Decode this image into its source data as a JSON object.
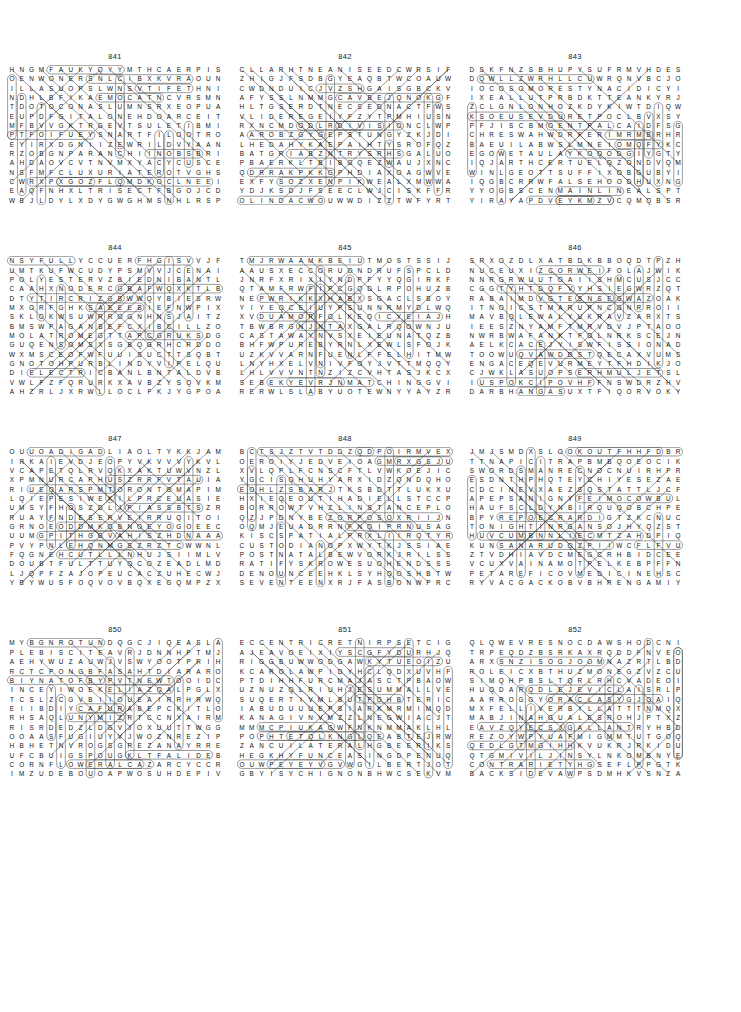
{
  "page": {
    "type": "word-search-puzzle-page",
    "columns": 3,
    "rows": 4,
    "grid_rows_per_puzzle": 21,
    "grid_cols_per_puzzle": 22
  },
  "puzzles": [
    {
      "number": "841",
      "grid": [
        "HNGMFAUKYQYYMTHCAERPIS",
        "OENWONERSNLCIBXKVRAOUN",
        "ILLASUOPSLWNSVTIFETHNI",
        "NDHLBFIKAEMOCATNCVRSMN",
        "TDOTOCONASLUMNSRXEOPUA",
        "EUPDFGITALONEHDOARCEIT",
        "MFBVVGKTRGEVTSULETIBMI",
        "PTFOIFUEYSNARTFILOOTRO",
        "EYIRXDGNIIZEWRILDVYAAN",
        "RZOBGNPARANCHIINOBSBRI",
        "AHDAOVCVTNVMXYACYCUSCE",
        "NSFMFCLUXURIATEROTVGHS",
        "CWRXPXGOZFLQMDKOCLNEEI",
        "EAQFNHXLTRISECTFBGOJCD",
        "WBJLDYLXDYGWGHMSNHLRSP"
      ],
      "found_words": [
        "TRISECT",
        "LUXURIATE",
        "RANCH",
        "ALONE",
        "RENOWNED",
        "ESPOUSAL",
        "CONSULTANT",
        "TRANSFIX",
        "ACHE"
      ]
    },
    {
      "number": "842",
      "grid": [
        "CLLARHTNEANISEEDCWRSIF",
        "ZHIGJFSDBGYEAQBTWCOAUW",
        "CWDNDUICJVZSHGAISGBCKV",
        "AFYSSLNMMGCAVBEJQNOKGF",
        "HLTGSERDTNECSEDNACTFWS",
        "VLIDEREGEIYFZYTPMHIUSN",
        "RXNCMDODLRDIVISIONCLWP",
        "AAROBZGYGEPSTUNGYZKJDI",
        "LHEDAHYKAEPAIHTYSROFQZ",
        "BATGRIABZNTRYSRHSGALUO",
        "PBAERKLTBIBGQEZWAUJXNC",
        "QDRRAKPKKGPHDIAXOAGWVE",
        "EXFYSOZXENPIKWEALXMWWA",
        "YDJKSDJFSEECLWJCISKFFR",
        "OLINDACWOUWWDIZZTWFYRT"
      ],
      "found_words": [
        "DIVISION",
        "OLINDA",
        "FORSYTHIA",
        "DESCENDANT",
        "ANISEED",
        "GUNSTPE",
        "HARTALL"
      ]
    },
    {
      "number": "843",
      "grid": [
        "DSKFNZSBHUPYSUFRMVHDES",
        "DQWLLZWRHLLCUWRQNVBCJO",
        "IOCOSOMORESTYNACIDICYI",
        "IXEALLUTPRBDKTTEANKYRJ",
        "ZCLGNLONHOZKDYKIWTDIQW",
        "KSOEUSEVDURETPOCLBVXSY",
        "PFJISCBMOENTPALCAIDFSG",
        "CHRESWAHWDRFERIMRMBRHR",
        "BAEUILABWSLMNEIOMQFYKC",
        "EGOWETAULAYKOQODGIYGTY",
        "IQJARTHCERTUELQZONDVQM",
        "WINLGEOTTSUFFIXOBGUBYI",
        "IQGBCRRWFALSEHOODHUXNG",
        "YYOGBSCENMAINLINEALSPT",
        "YIRAYAPDVEYKMZVCQMQBSR"
      ],
      "found_words": [
        "ACIDIC",
        "SUFFIX",
        "FALSEHOOD",
        "MAINLINE",
        "MORES",
        "COPTER",
        "SMORES"
      ]
    },
    {
      "number": "844",
      "grid": [
        "NSYFULLYCCUERFHGISVVJF",
        "UMTKUFWCUDYPSMVVJCENAI",
        "POLYESTERVZBIEDNIBANTL",
        "CAAHXNODERCGBAFWQXKTLB",
        "DTYTIRCRIZGBWWQYBIESRW",
        "MXORFGHKSAEEEBIEFNWPIX",
        "SKLOKWSUWRROGNHNSJAITZ",
        "BMSWPAGANBEFCXIBCILLZO",
        "MOLATROMEGTTAPCGRUKSDG",
        "GUQENSOMSXSGBQGRHCRDDO",
        "WXMSCEOFWFUUISUCTTSQBT",
        "GNOTOHPURBLINDYVIPELQU",
        "DIELECTRICBANLBNTALDVB",
        "VWLFZFQRURKXAVBZYSQVKM",
        "AHZRLJXRWLLOCLFKJYGPOA"
      ],
      "found_words": [
        "FULLY",
        "POLYESTER",
        "DIELECTRIC",
        "PAGAN",
        "LATROME",
        "PHOTON",
        "BLIND",
        "CODER"
      ]
    },
    {
      "number": "845",
      "grid": [
        "TMJRWAAMKBEIUTMOSTSSIJ",
        "AAUSXECCORUONDRUFSPCLD",
        "JNRFXRIXIYNDPFYYQGIRKF",
        "QTAMFRWFIPCGQDLRPOHUZB",
        "NEPWRIKKXHABXSGACLSBOY",
        "YIYEQCEIUYPSUNNRMYDLWQ",
        "XVDUAMORFOLKEQICYEIAJH",
        "TBWBRGNJNTAXGALRQOWNJU",
        "CASTAWAYNVSXEIEUNATQZB",
        "BHFWPUREBYRNLXEWLSFOJK",
        "UZKVVARNFUENLFFELHITMW",
        "LNYHXELVNIVFOYJVTTMQQY",
        "LHLVVVNTNZIZCVHTASJKCX",
        "SEBEKYEVRJNMATCHINGGVI",
        "RERWLSLABYUOTEWNYYAYZR"
      ],
      "found_words": [
        "UTMOST",
        "CASTAWAY",
        "MATCHING",
        "NORFOLK",
        "PURE",
        "SCORCH"
      ]
    },
    {
      "number": "846",
      "grid": [
        "SRXOZDLXATBDKBBOQDTPZH",
        "NUCEUXIZCORWEIFOLAJWIK",
        "NNRGRWUUTOAIISHMCUSJCC",
        "CGGTYHTDQFVYHSIEGWRZQT",
        "RABAIMDVGTESNSEGWAZOAK",
        "ITNOICSTMARUPNCGNRROII",
        "MAVBQLEWALYUKRAVZARXTS",
        "IEESZNYAMFTMRVDVJPTAOO",
        "NWRBWAFANKTFOLNRKSCEJN",
        "AELKCACEJYISWFISSIONAD",
        "TOOWUQVAWDDSTQECAXVUMS",
        "ENGACEQEVURMEYTFHDIKJO",
        "CJWKLASUOPSERHMULJETSL",
        "IUSPOKCIPOVHFFNSWDRZHV",
        "DARBHANGASUXTFIQORVOKY"
      ],
      "found_words": [
        "FISSION",
        "DARBHANGA",
        "ESPOUSAL",
        "PICKOPS",
        "CACKLE",
        "FOLA"
      ]
    },
    {
      "number": "847",
      "grid": [
        "OUUOADIGADLIAOLTYKKJAM",
        "IRKAIEVDJEOPYVKVVVYKVL",
        "VCAPETQLRVQKXAKTUWVNZL",
        "XPMNURCAPHUSZRRFVTAUIA",
        "RIUEQARSPMTORONTOMAPIM",
        "LQIEPESIWEKILPRCEUASIE",
        "UMSYFHOSZDLJPIASSBTSZR",
        "RUAYFNDESERVEIRRUQITOI",
        "GRNOEODDMKQBNOEYOGOEEC",
        "UUMGPITHGGVAHISZHDNAAA",
        "PVYPNLEHQNMGSZRZTCWWNL",
        "FQGNEHCUTLLLNHUJSIIMLV",
        "DOUBTFULTTUYQCOZEADLMD",
        "LJQPFZAJOPEUCACZUHECWJ",
        "YBYWUSFOQVOVBQXEGQMPZX"
      ],
      "found_words": [
        "TORONTO",
        "DESERVE",
        "DOUBTFUL",
        "CUTHENG",
        "LIKEWISE",
        "CAPE"
      ]
    },
    {
      "number": "848",
      "grid": [
        "BCTSJZTVTDDZQDPOIRMVEX",
        "OEROIYJEDVEIOAGMRXGSJU",
        "XVLQPLFCNSCFTLVWKOEJIC",
        "YGCISQHUHYARXIDZQNDQHO",
        "EOHLZSBARJTKSBDTTLUKXU",
        "HXIEQEOUTIHADIELLSTCCP",
        "BORROWTVHZLINSTANCEPLO",
        "QZJPDNYBEZORPOSOXRIIJN",
        "OQMJEUADRRNFNQIPRNUSAG",
        "KISCSPATIALPRXLIIRQTYR",
        "CUSTODIANOPXWYTKJSSIAE",
        "POSTNATALBEWVORKJRILSS",
        "RATIFYSKROWESUOHENDSSS",
        "DENOUNCEEHKLSYHQOSHBTW",
        "SEVENTEENXRJFASBONWPRC"
      ],
      "found_words": [
        "BORROW",
        "INSTANCE",
        "SPATIAL",
        "CUSTODIAN",
        "POSTNATAL",
        "RATIFY",
        "DENOUNCE",
        "SEVENTEEN",
        "HOUSEWORKS",
        "ADIELLS"
      ]
    },
    {
      "number": "849",
      "grid": [
        "JMJSMDXSLOOKOUTFHHFDBR",
        "TTNAPICITRAPBMBQOEOCIK",
        "SWORDSMANRECNOCNUIRHPR",
        "ESDNTHPHQTEYCHIYESEZAE",
        "CDCINEVXAEZSQSTATTLJCF",
        "APEPSANIGNYFEIMOCOWBUL",
        "HAUFSCLDYNBIRQUQOBCHPE",
        "BPYREPOECRARDIGTZKCNUC",
        "TONIGHTINRGANSOJHYQZST",
        "HUVCUMBNNLIECMTZAHDPIQ",
        "KUNSANARUDQZPIIWCFLFVU",
        "ZTVDHIAVDCMEGCRHBIDCEE",
        "VCUXVAINAMOTPELKEBPFFN",
        "PETAREFICOVMEDICINEHSC",
        "RYVACGACKOBVBHRENGAMIY"
      ],
      "found_words": [
        "LOOKOUT",
        "PARTICIPANT",
        "SWORDSMAN",
        "CONCERN",
        "TONIGHT",
        "KUNSAN",
        "KLEPTOMANIA",
        "MEDICINE",
        "VOCIFERATE",
        "MAGNETISM"
      ]
    },
    {
      "number": "850",
      "grid": [
        "MYBGNROTUNDQGCJIQEASLA",
        "PLEBISCITEAVRJDNNHPTMJ",
        "AEHYWUZAUWJVSWYOOTPRIH",
        "RCTCPONGBFASAHTDIARARO",
        "BIYNATOFBYPVTNEWTOOIDC",
        "INCEYIWOEKELIAZQALPGLX",
        "TCSLZCGVBIIOUEAIRRHRWQ",
        "EIIBDIYCAFURABEPCKITLO",
        "RHSAQLUNYMIZRTCCNXAIRM",
        "RISRDEDZLDGVJOXUUTTWGG",
        "OOAASFUGIUYVJWOZNREZIP",
        "HBHETNVROGSGREZANAYRRE",
        "UFCBUIGSPOUGKLTFALIDEB",
        "CORNFLOWERALCAZARCYCCR",
        "IMZUDEBOUOAPWOSUHDEPIV"
      ],
      "found_words": [
        "ROTUND",
        "PLEBISCITE",
        "CORNFLOWER",
        "ALCAZAR",
        "SWALLOW"
      ]
    },
    {
      "number": "851",
      "grid": [
        "ECCENTRICRETNIRPSETCIG",
        "AJEAVOEIXIYSCGFYDURHJQ",
        "RIGGBUWWODGAWKYTUEOIZU",
        "KCAROLAWPIDYHCLQDXUVHF",
        "PTDIHHFURCMAJASCTPBAOW",
        "UZNUZQLRIUHJESUMMALLVE",
        "SUQERTIVMLBUTPOHBTERIC",
        "IABUDUUUEPBIARKMRMIMQD",
        "KANAGIVNVMZZLNEGWIACJT",
        "MMMCPIUKAGWFNKNMMAKLHL",
        "POPHTETQLKNGLQEABTEJRW",
        "ZANCUILATERALHGBEERIKS",
        "HEGKHYFUNCEASINGDPENUQ",
        "OUWPEYEYVGVWGILBERTJOT",
        "GBYISYCHIGNONBHWCSEKVM"
      ],
      "found_words": [
        "ECCENTRIC",
        "SPRINTER",
        "CAROL",
        "UNCEASING",
        "GILBERT",
        "CHIGNON",
        "UNILATERAL",
        "SUBDUE",
        "GAWKY"
      ]
    },
    {
      "number": "852",
      "grid": [
        "QLQWEVRESNOCDAWSHODCNI",
        "TRPEQDZBSRKAXRQDDFNVEO",
        "ARXSNZISOGJOOMNAZRTLBD",
        "ROLEICXBTHUZMONEGZVZCU",
        "SIMQHPBSLTQRLRHCVADEOI",
        "HUQDARQDLEJEVICLAISRLP",
        "AARROGGYORACLASYGJQAIQ",
        "MXFELLIVERBILLATTTNMQX",
        "MABJINAHGUALESROHJPTXZ",
        "EAVZQYECSJGALLANTRYHBD",
        "REZOYWPYUAFMIGMMTUTGOQ",
        "QEDLGTMGIHHKVUKRJRKIDU",
        "QTGMIVILJINSYLNKOMBNYE",
        "CONTRARIETYHGSEFLPPGTK",
        "BACKSIDEVAWPSDMHKVSNZA"
      ],
      "found_words": [
        "CONSERVE",
        "ORACLE",
        "BILLIVERBILL",
        "HORSELAUGH",
        "GALLANTRY",
        "CONTRARIETY",
        "BACKSIDE",
        "DORADO"
      ]
    }
  ]
}
